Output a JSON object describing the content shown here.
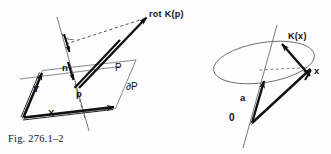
{
  "figure": {
    "caption": "Fig. 276.1–2",
    "background_color": "#fdfdfd",
    "ink_color": "#111111",
    "line_color": "#555555",
    "left_diagram": {
      "name": "curl-of-vector-field-on-oriented-surface-patch",
      "labels": {
        "rot_k_p": "rot K(p)",
        "normal": "n",
        "point": "p",
        "vector_x": "X",
        "vector_y": "Y",
        "surface": "P",
        "boundary": "∂P"
      }
    },
    "right_diagram": {
      "name": "vector-field-on-circle-about-axis",
      "labels": {
        "k_of_x": "K(x)",
        "point_x": "x",
        "axis_vector": "a",
        "origin": "0"
      }
    }
  }
}
